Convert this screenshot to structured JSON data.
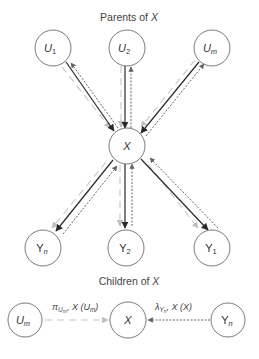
{
  "titles": {
    "parents": {
      "prefix": "Parents of ",
      "var": "X"
    },
    "children": {
      "prefix": "Children of ",
      "var": "X"
    }
  },
  "nodes": {
    "u1": {
      "main": "U",
      "sub": "1"
    },
    "u2": {
      "main": "U",
      "sub": "2"
    },
    "um": {
      "main": "U",
      "sub": "m"
    },
    "x": {
      "main": "X"
    },
    "yn": {
      "main": "Y",
      "sub": "n"
    },
    "y2": {
      "main": "Y",
      "sub": "2"
    },
    "y1": {
      "main": "Y",
      "sub": "1"
    },
    "bottom_um": {
      "main": "U",
      "sub": "m"
    },
    "bottom_x": {
      "main": "X"
    },
    "bottom_yn": {
      "main": "Y",
      "sub": "n"
    }
  },
  "messages": {
    "pi": {
      "symbol": "π",
      "sub": "U",
      "subsub": "m",
      "sep": ", X",
      "arg_open": " (",
      "arg": "U",
      "arg_sub": "m",
      "arg_close": ")"
    },
    "lambda": {
      "symbol": "λ",
      "sub": "Y",
      "subsub": "n",
      "sep": ", X",
      "arg_open": " (",
      "arg": "X",
      "arg_close": ")"
    }
  },
  "colors": {
    "node_stroke": "#6b6b6b",
    "solid_arrow": "#2a2a2a",
    "dotted_arrow": "#555555",
    "light_arrow": "#c8c8c8",
    "text": "#333333"
  }
}
